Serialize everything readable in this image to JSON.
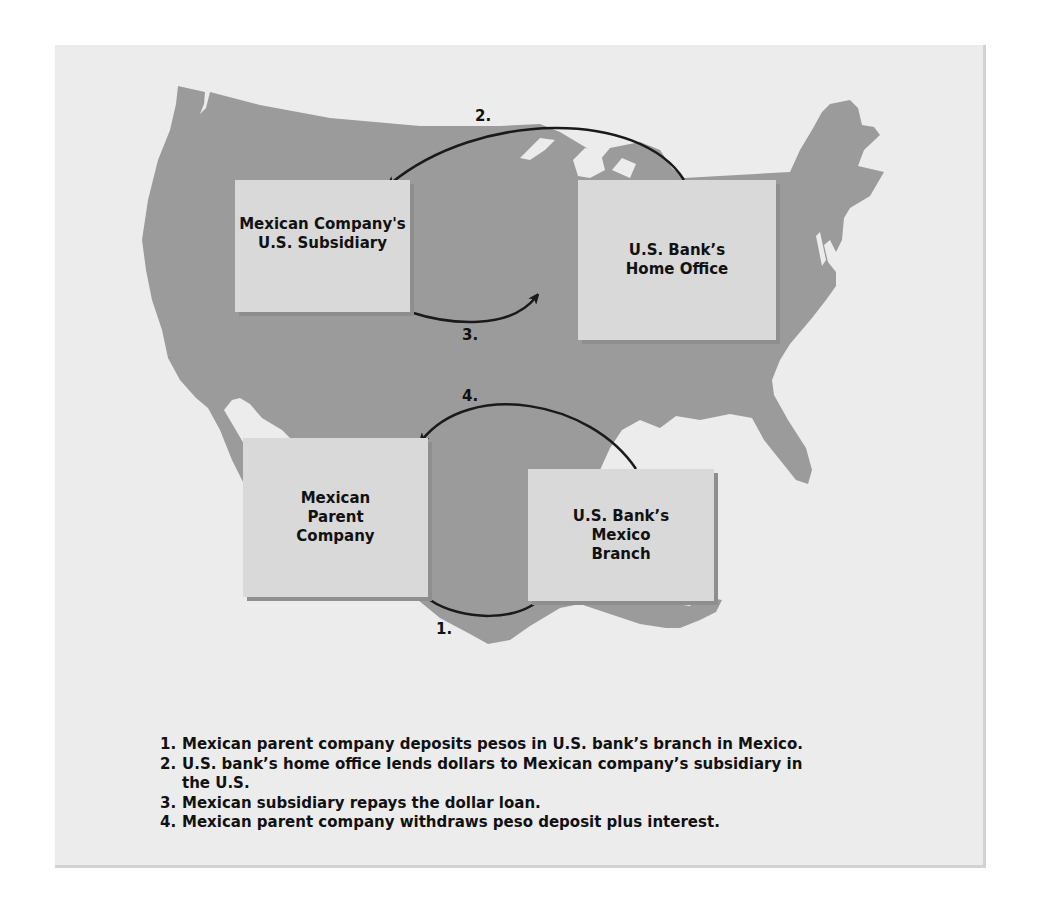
{
  "diagram": {
    "type": "flow-diagram-over-map",
    "background_map": "United States and Mexico silhouette",
    "colors": {
      "frame_background": "#ececec",
      "map_fill": "#9b9b9b",
      "box_fill": "#d9d9d9",
      "box_shadow": "#8e8e8e",
      "arrow": "#1a1a1a",
      "text": "#111111"
    },
    "nodes": [
      {
        "id": "subsidiary",
        "lines": [
          "Mexican Company's",
          "U.S. Subsidiary"
        ]
      },
      {
        "id": "home_office",
        "lines": [
          "U.S. Bank’s",
          "Home Office"
        ]
      },
      {
        "id": "parent",
        "lines": [
          "Mexican",
          "Parent",
          "Company"
        ]
      },
      {
        "id": "branch",
        "lines": [
          "U.S. Bank’s",
          "Mexico",
          "Branch"
        ]
      }
    ],
    "arrows": [
      {
        "label": "1.",
        "from": "parent",
        "to": "branch"
      },
      {
        "label": "2.",
        "from": "home_office",
        "to": "subsidiary"
      },
      {
        "label": "3.",
        "from": "subsidiary",
        "to": "home_office"
      },
      {
        "label": "4.",
        "from": "branch",
        "to": "parent"
      }
    ],
    "legend": [
      {
        "num": "1.",
        "text": "Mexican parent company deposits pesos in U.S. bank’s branch in Mexico."
      },
      {
        "num": "2.",
        "text": "U.S. bank’s home office lends dollars to Mexican company’s subsidiary in the U.S."
      },
      {
        "num": "3.",
        "text": "Mexican subsidiary repays the dollar loan."
      },
      {
        "num": "4.",
        "text": "Mexican parent company withdraws peso deposit plus interest."
      }
    ]
  }
}
